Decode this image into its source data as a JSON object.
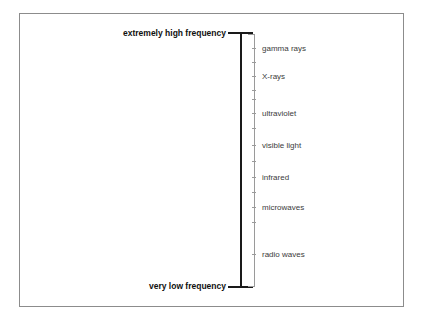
{
  "diagram": {
    "axis": {
      "top_label": "extremely high frequency",
      "bottom_label": "very low frequency",
      "orientation": "vertical",
      "direction": "high frequency at top, low frequency at bottom"
    },
    "bands": [
      {
        "label": "gamma rays",
        "y": 48
      },
      {
        "label": "X-rays",
        "y": 76
      },
      {
        "label": "ultraviolet",
        "y": 113
      },
      {
        "label": "visible light",
        "y": 145
      },
      {
        "label": "infrared",
        "y": 177
      },
      {
        "label": "microwaves",
        "y": 207
      },
      {
        "label": "radio waves",
        "y": 254
      }
    ],
    "ticks": [
      48,
      62,
      76,
      90,
      99,
      113,
      128,
      145,
      161,
      177,
      192,
      207,
      222,
      254
    ],
    "colors": {
      "frame": "#8c8c8c",
      "scale_bar": "#1a1a1a",
      "bracket": "#9a9a9a",
      "band_text": "#3b3b3b",
      "end_label_text": "#101010",
      "background": "#ffffff"
    }
  },
  "chart_data": {
    "type": "table",
    "ylabel": "frequency",
    "axis_top": "extremely high frequency",
    "axis_bottom": "very low frequency",
    "categories": [
      "gamma rays",
      "X-rays",
      "ultraviolet",
      "visible light",
      "infrared",
      "microwaves",
      "radio waves"
    ],
    "values": [
      7,
      6,
      5,
      4,
      3,
      2,
      1
    ],
    "legend": [],
    "grid": false
  }
}
